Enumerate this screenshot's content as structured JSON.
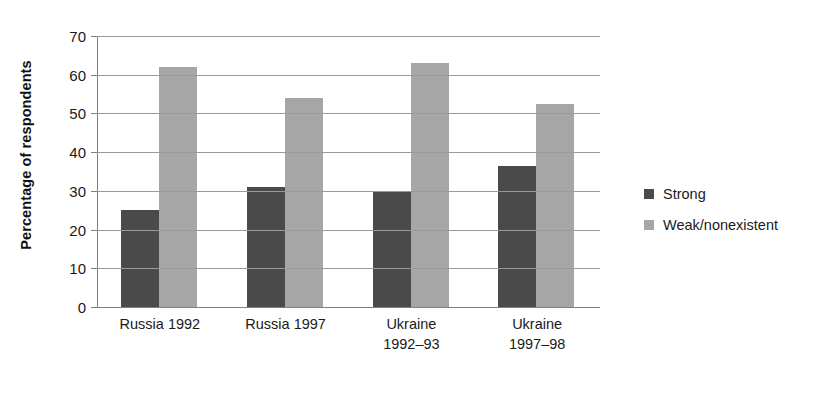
{
  "chart_data": {
    "type": "bar",
    "title": "",
    "xlabel": "",
    "ylabel": "Percentage of respondents",
    "ylim": [
      0,
      70
    ],
    "ytick_step": 10,
    "yticks": [
      70,
      60,
      50,
      40,
      30,
      20,
      10,
      0
    ],
    "grid": true,
    "legend_position": "right",
    "categories": [
      "Russia 1992",
      "Russia 1997",
      "Ukraine 1992–93",
      "Ukraine 1997–98"
    ],
    "category_lines": [
      [
        "Russia 1992",
        ""
      ],
      [
        "Russia 1997",
        ""
      ],
      [
        "Ukraine",
        "1992–93"
      ],
      [
        "Ukraine",
        "1997–98"
      ]
    ],
    "series": [
      {
        "name": "Strong",
        "color": "#4a4a4a",
        "values": [
          25,
          31,
          30,
          36.5
        ]
      },
      {
        "name": "Weak/nonexistent",
        "color": "#a6a6a6",
        "values": [
          62,
          54,
          63,
          52.5
        ]
      }
    ]
  },
  "legend": {
    "items": [
      {
        "label": "Strong",
        "color": "#4a4a4a"
      },
      {
        "label": "Weak/nonexistent",
        "color": "#a6a6a6"
      }
    ]
  },
  "colors": {
    "axis": "#808080",
    "gridline": "#9a9a9a",
    "text": "#1a1a1a",
    "background": "#ffffff"
  }
}
